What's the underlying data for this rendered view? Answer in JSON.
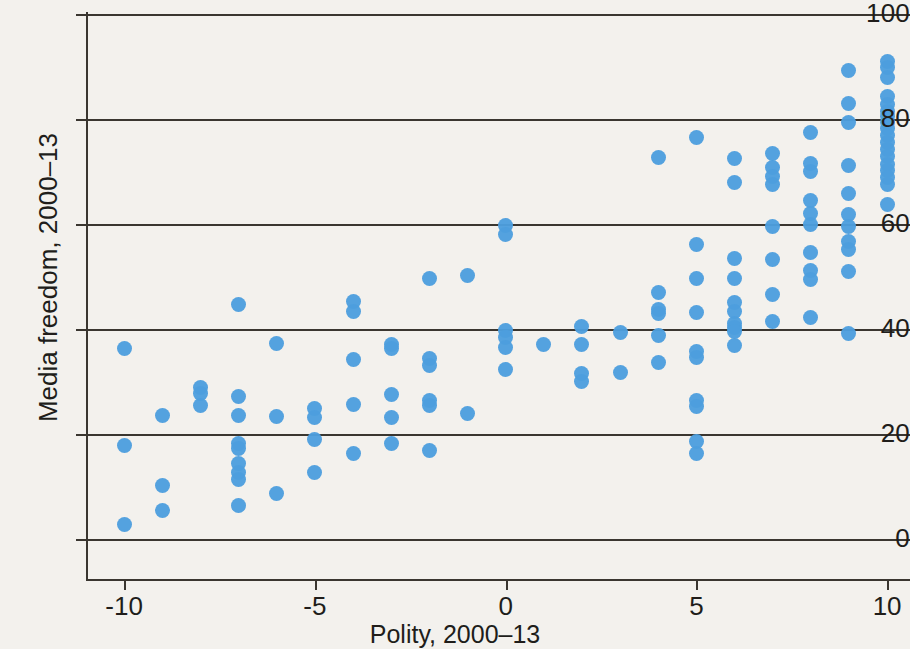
{
  "chart_data": {
    "type": "scatter",
    "title": "",
    "subtitle": "",
    "xlabel": "Polity, 2000–13",
    "ylabel": "Media freedom, 2000–13",
    "xlim": [
      -11,
      10.6
    ],
    "ylim": [
      -4,
      100
    ],
    "xticks": [
      -10,
      -5,
      0,
      5,
      10
    ],
    "xticklabels": [
      "-10",
      "-5",
      "0",
      "5",
      "10"
    ],
    "yticks": [
      0,
      20,
      40,
      60,
      80,
      100
    ],
    "yticklabels": [
      "0",
      "20",
      "40",
      "60",
      "80",
      "100"
    ],
    "grid": "horizontal",
    "legend": null,
    "marker_color": "#4d9ede",
    "marker_shape": "circle",
    "axis_color": "#3a3630",
    "background_color": "#f3f1ed",
    "series": [
      {
        "name": "countries",
        "points": [
          [
            -10,
            36.3
          ],
          [
            -10,
            17.8
          ],
          [
            -10,
            2.7
          ],
          [
            -9,
            23.6
          ],
          [
            -9,
            10.2
          ],
          [
            -9,
            5.4
          ],
          [
            -8,
            28.9
          ],
          [
            -8,
            27.8
          ],
          [
            -8,
            25.4
          ],
          [
            -7,
            44.6
          ],
          [
            -7,
            27.1
          ],
          [
            -7,
            23.6
          ],
          [
            -7,
            18.2
          ],
          [
            -7,
            17.2
          ],
          [
            -7,
            14.3
          ],
          [
            -7,
            12.6
          ],
          [
            -7,
            11.3
          ],
          [
            -7,
            6.3
          ],
          [
            -6,
            37.3
          ],
          [
            -6,
            23.4
          ],
          [
            -6,
            8.6
          ],
          [
            -5,
            24.8
          ],
          [
            -5,
            23.2
          ],
          [
            -5,
            19.0
          ],
          [
            -5,
            12.7
          ],
          [
            -4,
            45.3
          ],
          [
            -4,
            43.3
          ],
          [
            -4,
            34.2
          ],
          [
            -4,
            25.7
          ],
          [
            -4,
            16.3
          ],
          [
            -3,
            37.1
          ],
          [
            -3,
            36.3
          ],
          [
            -3,
            27.6
          ],
          [
            -3,
            23.1
          ],
          [
            -3,
            18.1
          ],
          [
            -2,
            49.7
          ],
          [
            -2,
            34.3
          ],
          [
            -2,
            33.0
          ],
          [
            -2,
            26.3
          ],
          [
            -2,
            25.5
          ],
          [
            -2,
            16.8
          ],
          [
            -1,
            50.2
          ],
          [
            -1,
            24.0
          ],
          [
            0,
            59.8
          ],
          [
            0,
            58.0
          ],
          [
            0,
            39.7
          ],
          [
            0,
            38.3
          ],
          [
            0,
            36.5
          ],
          [
            0,
            32.3
          ],
          [
            1,
            37.0
          ],
          [
            2,
            40.4
          ],
          [
            2,
            37.0
          ],
          [
            2,
            31.5
          ],
          [
            2,
            30.0
          ],
          [
            3,
            39.4
          ],
          [
            3,
            31.7
          ],
          [
            4,
            72.7
          ],
          [
            4,
            47.0
          ],
          [
            4,
            43.8
          ],
          [
            4,
            43.0
          ],
          [
            4,
            38.8
          ],
          [
            4,
            33.6
          ],
          [
            5,
            76.5
          ],
          [
            5,
            56.1
          ],
          [
            5,
            49.6
          ],
          [
            5,
            43.2
          ],
          [
            5,
            35.8
          ],
          [
            5,
            34.5
          ],
          [
            5,
            26.3
          ],
          [
            5,
            25.3
          ],
          [
            5,
            18.5
          ],
          [
            5,
            16.2
          ],
          [
            6,
            72.4
          ],
          [
            6,
            68.0
          ],
          [
            6,
            53.4
          ],
          [
            6,
            49.7
          ],
          [
            6,
            45.0
          ],
          [
            6,
            43.3
          ],
          [
            6,
            41.0
          ],
          [
            6,
            40.2
          ],
          [
            6,
            39.6
          ],
          [
            6,
            36.8
          ],
          [
            7,
            73.4
          ],
          [
            7,
            70.8
          ],
          [
            7,
            69.1
          ],
          [
            7,
            67.5
          ],
          [
            7,
            59.5
          ],
          [
            7,
            53.3
          ],
          [
            7,
            46.5
          ],
          [
            7,
            41.4
          ],
          [
            8,
            77.5
          ],
          [
            8,
            71.5
          ],
          [
            8,
            70.0
          ],
          [
            8,
            64.5
          ],
          [
            8,
            62.0
          ],
          [
            8,
            60.0
          ],
          [
            8,
            54.5
          ],
          [
            8,
            51.2
          ],
          [
            8,
            49.5
          ],
          [
            8,
            42.2
          ],
          [
            9,
            89.3
          ],
          [
            9,
            83.0
          ],
          [
            9,
            79.3
          ],
          [
            9,
            71.2
          ],
          [
            9,
            65.8
          ],
          [
            9,
            61.8
          ],
          [
            9,
            59.5
          ],
          [
            9,
            56.6
          ],
          [
            9,
            55.2
          ],
          [
            9,
            51.0
          ],
          [
            9,
            39.1
          ],
          [
            10,
            91.0
          ],
          [
            10,
            89.8
          ],
          [
            10,
            88.0
          ],
          [
            10,
            84.2
          ],
          [
            10,
            82.8
          ],
          [
            10,
            81.4
          ],
          [
            10,
            80.4
          ],
          [
            10,
            79.4
          ],
          [
            10,
            78.2
          ],
          [
            10,
            76.8
          ],
          [
            10,
            75.5
          ],
          [
            10,
            74.2
          ],
          [
            10,
            72.8
          ],
          [
            10,
            71.4
          ],
          [
            10,
            70.2
          ],
          [
            10,
            68.8
          ],
          [
            10,
            67.5
          ],
          [
            10,
            63.8
          ]
        ]
      }
    ]
  }
}
